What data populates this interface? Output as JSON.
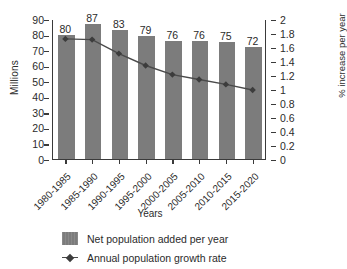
{
  "chart_data": {
    "type": "bar",
    "title": "",
    "subtitle": "",
    "xlabel": "Years",
    "ylabel": "Millions",
    "y2label": "% increase per year",
    "categories": [
      "1980-1985",
      "1985-1990",
      "1990-1995",
      "1995-2000",
      "2000-2005",
      "2005-2010",
      "2010-2015",
      "2015-2020"
    ],
    "ylim": [
      0,
      90
    ],
    "y2lim": [
      0,
      2
    ],
    "yticks": [
      0,
      10,
      20,
      30,
      40,
      50,
      60,
      70,
      80,
      90
    ],
    "y2ticks": [
      "0",
      "0.2",
      "0.4",
      "0.6",
      "0.8",
      "1",
      "1.2",
      "1.4",
      "1.6",
      "1.8",
      "2"
    ],
    "grid": false,
    "legend_position": "bottom-left",
    "series": [
      {
        "name": "Net population added per year",
        "type": "bar",
        "axis": "left",
        "color": "#7c7c7c",
        "values": [
          80,
          87,
          83,
          79,
          76,
          76,
          75,
          72
        ],
        "labels": [
          "80",
          "87",
          "83",
          "79",
          "76",
          "76",
          "75",
          "72"
        ]
      },
      {
        "name": "Annual population growth rate",
        "type": "line",
        "axis": "right",
        "color": "#4a4a4a",
        "marker": "diamond",
        "values": [
          1.73,
          1.72,
          1.52,
          1.35,
          1.22,
          1.15,
          1.08,
          1.0
        ]
      }
    ]
  },
  "legend": {
    "items": [
      {
        "label": "Net population added per year",
        "marker": "bar-swatch"
      },
      {
        "label": "Annual population growth rate",
        "marker": "line-diamond"
      }
    ]
  },
  "colors": {
    "bar": "#7c7c7c",
    "line": "#4a4a4a",
    "axis": "#3a3a3a",
    "text": "#2b2b2b",
    "background": "#ffffff"
  }
}
